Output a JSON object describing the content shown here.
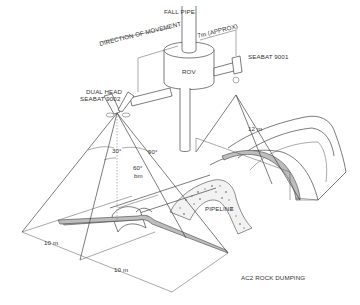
{
  "diagram": {
    "title": "AC2 ROCK DUMPING",
    "labels": {
      "fall_pipe": "FALL PIPE",
      "direction": "DIRECTION OF MOVEMENT",
      "offset": "7m (APPROX)",
      "rov": "ROV",
      "seabat_single": "SEABAT 9001",
      "dual_head_line1": "DUAL HEAD",
      "dual_head_line2": "SEABAT 9002",
      "angle_left": "30°",
      "angle_right": "90°",
      "beam_angle": "60°",
      "beam_unit": "bm",
      "swath_right": "12 m",
      "pipeline": "PIPELINE",
      "dim_a": "10 m",
      "dim_b": "10 m"
    },
    "colors": {
      "line": "#444444",
      "band": "#bdbdbd",
      "background": "#ffffff"
    }
  }
}
